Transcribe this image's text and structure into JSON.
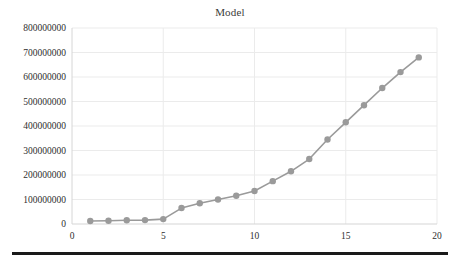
{
  "chart_data": {
    "type": "line",
    "title": "Model",
    "xlabel": "",
    "ylabel": "",
    "x": [
      1,
      2,
      3,
      4,
      5,
      6,
      7,
      8,
      9,
      10,
      11,
      12,
      13,
      14,
      15,
      16,
      17,
      18,
      19
    ],
    "values": [
      12000000,
      13000000,
      15000000,
      16000000,
      20000000,
      65000000,
      85000000,
      100000000,
      115000000,
      135000000,
      175000000,
      215000000,
      265000000,
      345000000,
      415000000,
      485000000,
      555000000,
      620000000,
      680000000
    ],
    "series": [
      {
        "name": "Model",
        "values": [
          12000000,
          13000000,
          15000000,
          16000000,
          20000000,
          65000000,
          85000000,
          100000000,
          115000000,
          135000000,
          175000000,
          215000000,
          265000000,
          345000000,
          415000000,
          485000000,
          555000000,
          620000000,
          680000000
        ]
      }
    ],
    "xlim": [
      0,
      20
    ],
    "ylim": [
      0,
      800000000
    ],
    "x_ticks": [
      0,
      5,
      10,
      15,
      20
    ],
    "x_tick_labels": [
      "0",
      "5",
      "10",
      "15",
      "20"
    ],
    "y_ticks": [
      0,
      100000000,
      200000000,
      300000000,
      400000000,
      500000000,
      600000000,
      700000000,
      800000000
    ],
    "y_tick_labels": [
      "0",
      "100000000",
      "200000000",
      "300000000",
      "400000000",
      "500000000",
      "600000000",
      "700000000",
      "800000000"
    ],
    "grid": true,
    "legend": false,
    "marker": "circle",
    "line_color": "#9a9a9a",
    "marker_color": "#9a9a9a",
    "grid_color": "#ebebeb",
    "axis_color": "#d6d6d6",
    "background_color": "#ffffff"
  }
}
